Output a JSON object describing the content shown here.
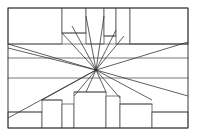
{
  "figure": {
    "style": {
      "background_color": "#ffffff",
      "frame_stroke": "#3c3c3c",
      "structure_stroke": "#555555",
      "ray_stroke": "#2b2b2b",
      "frame_stroke_width": 1,
      "structure_stroke_width": 0.8,
      "ray_stroke_width": 0.75
    },
    "frame": {
      "x": 8,
      "y": 8,
      "width": 180,
      "height": 120
    },
    "vanishing_point": {
      "x": 96,
      "y": 70,
      "label": "vanishing-point"
    },
    "horizon_lines": [
      {
        "name": "upper-band-line",
        "y": 44,
        "x1": 8,
        "x2": 188
      },
      {
        "name": "horizon-line",
        "y": 58,
        "x1": 8,
        "x2": 188
      },
      {
        "name": "lower-band-line",
        "y": 78,
        "x1": 8,
        "x2": 188
      }
    ],
    "rays": [
      {
        "name": "ray-upper-left-far",
        "x": 8,
        "y": 44
      },
      {
        "name": "ray-upper-left-near",
        "x": 8,
        "y": 48
      },
      {
        "name": "ray-top-left-block",
        "x": 62,
        "y": 33
      },
      {
        "name": "ray-top-left-inner",
        "x": 72,
        "y": 26
      },
      {
        "name": "ray-top-center-left",
        "x": 86,
        "y": 16
      },
      {
        "name": "ray-top-center-right",
        "x": 104,
        "y": 16
      },
      {
        "name": "ray-top-right-inner",
        "x": 116,
        "y": 30
      },
      {
        "name": "ray-top-right-outer",
        "x": 124,
        "y": 36
      },
      {
        "name": "ray-upper-right-far",
        "x": 188,
        "y": 42
      },
      {
        "name": "ray-lower-left-far",
        "x": 8,
        "y": 118
      },
      {
        "name": "ray-lower-left-mid",
        "x": 42,
        "y": 100
      },
      {
        "name": "ray-bottom-left-block",
        "x": 74,
        "y": 96
      },
      {
        "name": "ray-bottom-center-left",
        "x": 86,
        "y": 92
      },
      {
        "name": "ray-bottom-center-right",
        "x": 106,
        "y": 92
      },
      {
        "name": "ray-bottom-right-block",
        "x": 120,
        "y": 98
      },
      {
        "name": "ray-lower-right-mid",
        "x": 152,
        "y": 100
      },
      {
        "name": "ray-lower-right-far",
        "x": 188,
        "y": 96
      }
    ],
    "upper_blocks": [
      {
        "name": "block-upper-left-wide",
        "points": "8,8 8,44 62,44 62,8"
      },
      {
        "name": "block-upper-left-riser",
        "points": "62,8 62,33 86,33 86,8"
      },
      {
        "name": "block-upper-center-tall",
        "points": "86,8 86,44 104,44 104,8"
      },
      {
        "name": "block-upper-center-right",
        "points": "104,8 104,36 116,36 116,8"
      },
      {
        "name": "block-upper-right-tower",
        "points": "116,8 116,44 130,44 130,8"
      },
      {
        "name": "block-upper-right-wide",
        "points": "130,8 130,44 188,44 188,8"
      }
    ],
    "lower_blocks": [
      {
        "name": "block-lower-left-low",
        "points": "8,112 8,128 42,128 42,112"
      },
      {
        "name": "block-lower-left-mid",
        "points": "42,100 42,128 62,128 62,100"
      },
      {
        "name": "block-lower-center-left",
        "points": "62,104 62,128 74,128 74,104"
      },
      {
        "name": "block-lower-center-tall",
        "points": "74,92 74,128 106,128 106,92"
      },
      {
        "name": "block-lower-center-right",
        "points": "106,96 106,128 120,128 120,96"
      },
      {
        "name": "block-lower-right-mid",
        "points": "120,104 120,128 152,128 152,104"
      },
      {
        "name": "block-lower-right-low",
        "points": "152,112 152,128 188,128 188,112"
      }
    ],
    "connector_lines": [
      {
        "name": "upper-left-step-top",
        "d": "M62,33 L86,33"
      },
      {
        "name": "upper-right-step-top",
        "d": "M104,36 L116,36"
      },
      {
        "name": "upper-right-inner-edge",
        "d": "M130,44 L188,44"
      },
      {
        "name": "lower-left-step-top",
        "d": "M42,100 L62,100"
      },
      {
        "name": "lower-right-step-top",
        "d": "M120,104 L152,104"
      },
      {
        "name": "lower-left-low-top",
        "d": "M8,112 L42,112"
      },
      {
        "name": "lower-right-low-top",
        "d": "M152,112 L188,112"
      },
      {
        "name": "lower-center-tall-top",
        "d": "M74,92 L106,92"
      }
    ]
  }
}
